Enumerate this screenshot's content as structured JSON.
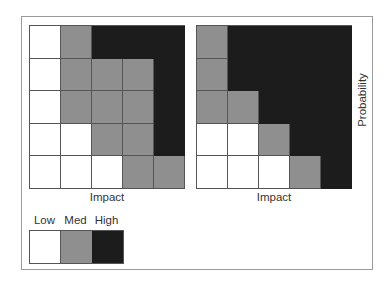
{
  "colors": {
    "Low": "#ffffff",
    "Med": "#8f8f8f",
    "High": "#1c1c1c"
  },
  "left_matrix": {
    "xlabel": "Impact",
    "cells": [
      [
        "L",
        "M",
        "H",
        "H",
        "H"
      ],
      [
        "L",
        "M",
        "M",
        "M",
        "H"
      ],
      [
        "L",
        "M",
        "M",
        "M",
        "H"
      ],
      [
        "L",
        "L",
        "M",
        "M",
        "H"
      ],
      [
        "L",
        "L",
        "L",
        "M",
        "M"
      ]
    ]
  },
  "right_matrix": {
    "xlabel": "Impact",
    "ylabel": "Probability",
    "cells": [
      [
        "M",
        "H",
        "H",
        "H",
        "H"
      ],
      [
        "M",
        "H",
        "H",
        "H",
        "H"
      ],
      [
        "M",
        "M",
        "H",
        "H",
        "H"
      ],
      [
        "L",
        "L",
        "M",
        "H",
        "H"
      ],
      [
        "L",
        "L",
        "L",
        "M",
        "H"
      ]
    ]
  },
  "legend": {
    "items": [
      {
        "label": "Low",
        "key": "L"
      },
      {
        "label": "Med",
        "key": "M"
      },
      {
        "label": "High",
        "key": "H"
      }
    ]
  }
}
